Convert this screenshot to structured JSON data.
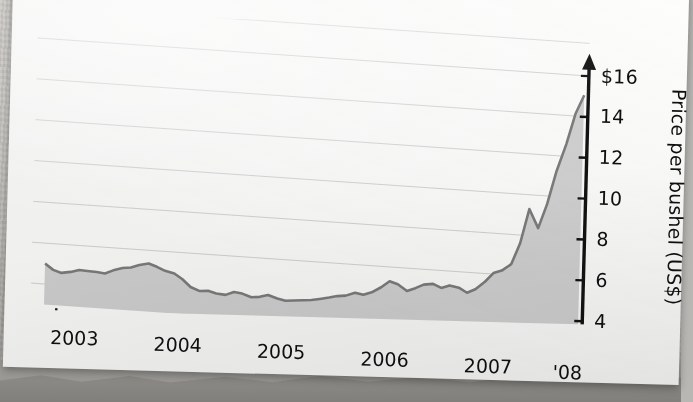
{
  "media": {
    "kind": "photograph-of-printed-page",
    "page_color": "#fdfdfc",
    "surface_color": "#b9b7b4",
    "rotation_degrees": 1.55,
    "cropped_headline_fragment": "••"
  },
  "chart_data": {
    "type": "area",
    "title": "",
    "subtitle": "",
    "xlabel": "",
    "ylabel": "Price per bushel (US$)",
    "ylim": [
      3.0,
      16.8
    ],
    "xlim": [
      2002.75,
      2008.08
    ],
    "grid": true,
    "grid_axis": "y",
    "legend": null,
    "legend_position": "none",
    "y_ticks": [
      4,
      6,
      8,
      10,
      12,
      14,
      16
    ],
    "y_tick_labels": [
      "4",
      "6",
      "8",
      "10",
      "12",
      "14",
      "$16"
    ],
    "x_ticks": [
      2003,
      2004,
      2005,
      2006,
      2007,
      2008
    ],
    "x_tick_labels": [
      "2003",
      "2004",
      "2005",
      "2006",
      "2007",
      "'08"
    ],
    "x_minor_ticks_per_year": 4,
    "x_axis_arrow": "left",
    "y_axis_arrow": "up",
    "line_color": "#7d7d7d",
    "fill_color": "#d2d2d2",
    "axis_color": "#121212",
    "grid_color": "#c8c8c8",
    "series": [
      {
        "name": "Price per bushel (US$)",
        "x": [
          2002.88,
          2002.96,
          2003.04,
          2003.13,
          2003.21,
          2003.29,
          2003.38,
          2003.46,
          2003.54,
          2003.63,
          2003.71,
          2003.79,
          2003.88,
          2003.96,
          2004.04,
          2004.13,
          2004.21,
          2004.29,
          2004.38,
          2004.46,
          2004.54,
          2004.63,
          2004.71,
          2004.79,
          2004.88,
          2004.96,
          2005.04,
          2005.13,
          2005.21,
          2005.29,
          2005.38,
          2005.46,
          2005.54,
          2005.63,
          2005.71,
          2005.79,
          2005.88,
          2005.96,
          2006.04,
          2006.13,
          2006.21,
          2006.29,
          2006.38,
          2006.46,
          2006.54,
          2006.63,
          2006.71,
          2006.79,
          2006.88,
          2006.96,
          2007.04,
          2007.13,
          2007.21,
          2007.29,
          2007.38,
          2007.46,
          2007.54,
          2007.63,
          2007.71,
          2007.79,
          2007.88,
          2007.96,
          2008.04
        ],
        "y": [
          5.0,
          4.72,
          4.6,
          4.68,
          4.8,
          4.78,
          4.76,
          4.72,
          4.9,
          5.05,
          5.1,
          5.25,
          5.35,
          5.22,
          5.05,
          4.95,
          4.7,
          4.35,
          4.18,
          4.22,
          4.12,
          4.08,
          4.25,
          4.2,
          4.05,
          4.1,
          4.22,
          4.08,
          4.0,
          4.04,
          4.08,
          4.12,
          4.2,
          4.3,
          4.4,
          4.45,
          4.62,
          4.55,
          4.7,
          4.98,
          5.3,
          5.18,
          4.88,
          5.05,
          5.25,
          5.32,
          5.15,
          5.3,
          5.22,
          5.0,
          5.2,
          5.6,
          6.05,
          6.2,
          6.55,
          7.6,
          9.3,
          8.4,
          9.6,
          11.2,
          12.6,
          14.1,
          15.05
        ]
      }
    ],
    "annotations": [
      {
        "text": "prices flat near $4–5 through 2003–2006"
      },
      {
        "text": "sharp run-up begins in 2007, peaking near $15"
      }
    ]
  },
  "axes": {
    "y_title": "Price per bushel (US$)",
    "y_labels": [
      "$16",
      "14",
      "12",
      "10",
      "8",
      "6",
      "4"
    ],
    "x_labels": [
      "2003",
      "2004",
      "2005",
      "2006",
      "2007",
      "'08"
    ]
  }
}
